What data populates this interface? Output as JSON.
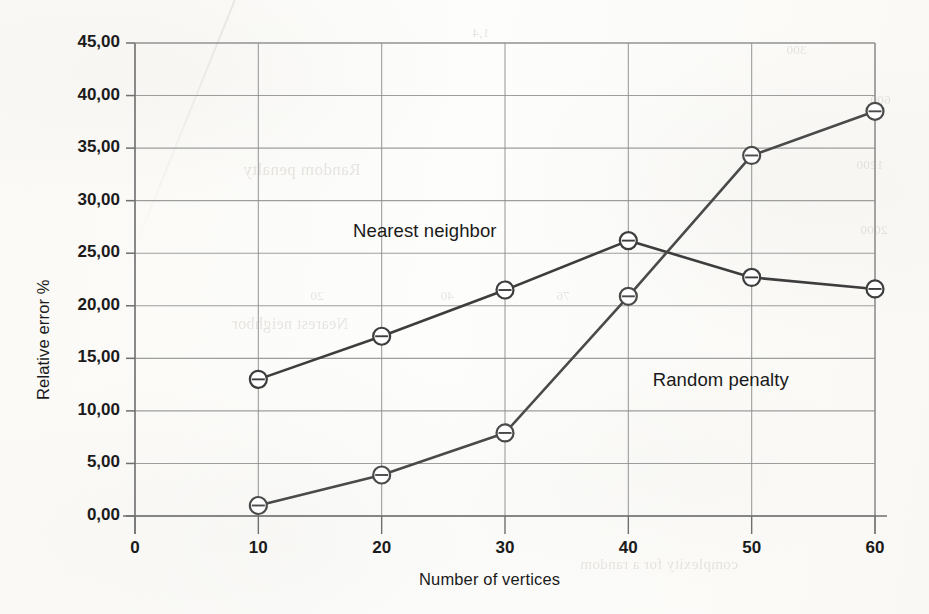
{
  "chart_data": {
    "type": "line",
    "title": "",
    "xlabel": "Number of vertices",
    "ylabel": "Relative error %",
    "x": [
      10,
      20,
      30,
      40,
      50,
      60
    ],
    "xlim": [
      0,
      60
    ],
    "ylim": [
      0,
      45
    ],
    "xticks": [
      "0",
      "10",
      "20",
      "30",
      "40",
      "50",
      "60"
    ],
    "xtick_values": [
      0,
      10,
      20,
      30,
      40,
      50,
      60
    ],
    "yticks": [
      "0,00",
      "5,00",
      "10,00",
      "15,00",
      "20,00",
      "25,00",
      "30,00",
      "35,00",
      "40,00",
      "45,00"
    ],
    "ytick_values": [
      0,
      5,
      10,
      15,
      20,
      25,
      30,
      35,
      40,
      45
    ],
    "decimal_separator": ",",
    "grid": "both",
    "legend_position": "inline-annotations",
    "marker": "open-circle",
    "series": [
      {
        "name": "Nearest neighbor",
        "values": [
          13.0,
          17.1,
          21.5,
          26.2,
          22.7,
          21.6
        ],
        "color": "#3d3d3d"
      },
      {
        "name": "Random penalty",
        "values": [
          1.0,
          3.9,
          7.9,
          20.9,
          34.3,
          38.5
        ],
        "color": "#4a4a4a"
      }
    ],
    "annotations": [
      {
        "text": "Nearest neighbor",
        "x": 23.5,
        "y": 27.0
      },
      {
        "text": "Random penalty",
        "x": 47.5,
        "y": 12.8
      }
    ]
  },
  "axes": {
    "y_title": "Relative error %",
    "x_title": "Number of vertices"
  },
  "colors": {
    "line": "#3d3d3d",
    "grid": "#8d8d8d",
    "axis": "#6f6f6f",
    "text": "#1b1b1b",
    "paper": "#fdfdfb"
  },
  "ghost_text": [
    {
      "text": "Random penalty",
      "x": 243,
      "y": 160,
      "size": 17
    },
    {
      "text": "Nearest neighbor",
      "x": 232,
      "y": 315,
      "size": 16
    },
    {
      "text": "complexity for a random",
      "x": 580,
      "y": 556,
      "size": 15
    },
    {
      "text": "600",
      "x": 870,
      "y": 92,
      "size": 13
    },
    {
      "text": "1200",
      "x": 856,
      "y": 157,
      "size": 13
    },
    {
      "text": "2000",
      "x": 860,
      "y": 222,
      "size": 13
    },
    {
      "text": "300",
      "x": 786,
      "y": 42,
      "size": 13
    },
    {
      "text": "20",
      "x": 310,
      "y": 288,
      "size": 13
    },
    {
      "text": "40",
      "x": 440,
      "y": 288,
      "size": 13
    },
    {
      "text": "76",
      "x": 556,
      "y": 288,
      "size": 13
    },
    {
      "text": "1,4",
      "x": 472,
      "y": 25,
      "size": 13
    }
  ]
}
